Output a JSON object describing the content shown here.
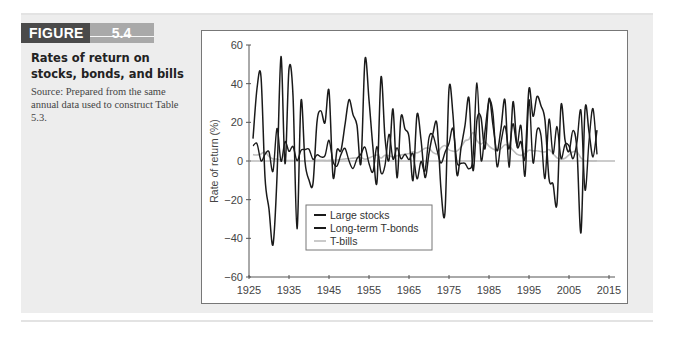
{
  "figure": {
    "label": "FIGURE",
    "number": "5.4",
    "title": "Rates of return on stocks, bonds, and bills",
    "source": "Source: Prepared from the same annual data used to construct Table 5.3."
  },
  "colors": {
    "stocks": "#1a1a1a",
    "bonds": "#1a1a1a",
    "bills": "#bdbdbd",
    "zero_line": "#9a9a9a",
    "axis": "#555555"
  },
  "chart_data": {
    "type": "line",
    "title": "Rates of return on stocks, bonds, and bills",
    "xlabel": "",
    "ylabel": "Rate of return (%)",
    "xlim": [
      1925,
      2015
    ],
    "ylim": [
      -60,
      60
    ],
    "xticks": [
      1925,
      1935,
      1945,
      1955,
      1965,
      1975,
      1985,
      1995,
      2005,
      2015
    ],
    "yticks": [
      -60,
      -40,
      -20,
      0,
      20,
      40,
      60
    ],
    "grid": false,
    "legend_position": "lower-left inside",
    "x": [
      1926,
      1927,
      1928,
      1929,
      1930,
      1931,
      1932,
      1933,
      1934,
      1935,
      1936,
      1937,
      1938,
      1939,
      1940,
      1941,
      1942,
      1943,
      1944,
      1945,
      1946,
      1947,
      1948,
      1949,
      1950,
      1951,
      1952,
      1953,
      1954,
      1955,
      1956,
      1957,
      1958,
      1959,
      1960,
      1961,
      1962,
      1963,
      1964,
      1965,
      1966,
      1967,
      1968,
      1969,
      1970,
      1971,
      1972,
      1973,
      1974,
      1975,
      1976,
      1977,
      1978,
      1979,
      1980,
      1981,
      1982,
      1983,
      1984,
      1985,
      1986,
      1987,
      1988,
      1989,
      1990,
      1991,
      1992,
      1993,
      1994,
      1995,
      1996,
      1997,
      1998,
      1999,
      2000,
      2001,
      2002,
      2003,
      2004,
      2005,
      2006,
      2007,
      2008,
      2009,
      2010,
      2011,
      2012
    ],
    "series": [
      {
        "name": "Large stocks",
        "values": [
          11.6,
          37.5,
          43.6,
          -8.4,
          -24.9,
          -43.3,
          -8.2,
          54.0,
          -1.4,
          47.7,
          33.9,
          -35.0,
          31.1,
          -0.4,
          -9.8,
          -11.6,
          20.3,
          25.9,
          19.8,
          36.4,
          -8.1,
          5.7,
          5.5,
          18.8,
          31.7,
          24.0,
          18.4,
          -1.0,
          52.6,
          31.6,
          6.6,
          -10.8,
          43.4,
          12.0,
          0.5,
          26.9,
          -8.7,
          22.8,
          16.5,
          12.5,
          -10.1,
          24.0,
          11.1,
          -8.5,
          4.0,
          14.3,
          19.0,
          -14.7,
          -26.5,
          37.2,
          23.8,
          -7.2,
          6.6,
          18.4,
          32.4,
          -4.9,
          21.4,
          22.5,
          6.3,
          32.2,
          18.5,
          5.2,
          16.8,
          31.5,
          -3.2,
          30.6,
          7.7,
          10.0,
          1.3,
          37.4,
          23.1,
          33.4,
          28.6,
          21.0,
          -9.1,
          -11.9,
          -22.1,
          28.7,
          10.9,
          4.9,
          15.8,
          5.5,
          -37.0,
          26.5,
          15.1,
          2.1,
          16.0
        ]
      },
      {
        "name": "Long-term T-bonds",
        "values": [
          7.8,
          8.9,
          0.1,
          3.4,
          4.7,
          -5.3,
          16.8,
          -0.1,
          10.0,
          5.0,
          7.5,
          0.2,
          5.5,
          5.9,
          6.1,
          0.9,
          3.2,
          2.1,
          2.8,
          10.7,
          -0.1,
          -2.6,
          3.4,
          6.5,
          0.1,
          -3.9,
          1.2,
          3.6,
          7.2,
          -1.3,
          -5.6,
          7.5,
          -6.1,
          -2.3,
          13.8,
          1.0,
          6.9,
          1.2,
          3.5,
          0.7,
          3.7,
          -9.2,
          -0.3,
          -5.1,
          12.1,
          13.2,
          5.7,
          -1.1,
          4.4,
          9.2,
          16.8,
          -0.7,
          -1.2,
          -1.2,
          -4.0,
          1.9,
          40.4,
          0.7,
          15.4,
          31.0,
          24.4,
          -2.7,
          9.7,
          18.1,
          6.2,
          19.3,
          8.1,
          18.2,
          -7.8,
          31.7,
          -0.9,
          15.9,
          13.1,
          -9.0,
          21.5,
          3.7,
          17.8,
          1.4,
          8.5,
          7.8,
          1.2,
          9.9,
          25.9,
          -14.9,
          10.1,
          27.1,
          3.4
        ]
      },
      {
        "name": "T-bills",
        "values": [
          3.3,
          3.1,
          3.6,
          4.7,
          2.4,
          1.1,
          1.0,
          0.3,
          0.2,
          0.2,
          0.2,
          0.3,
          0.0,
          0.0,
          0.0,
          0.1,
          0.3,
          0.4,
          0.3,
          0.3,
          0.4,
          0.5,
          0.8,
          1.1,
          1.2,
          1.5,
          1.7,
          1.8,
          0.9,
          1.6,
          2.5,
          3.1,
          1.5,
          3.0,
          2.7,
          2.1,
          2.7,
          3.1,
          3.5,
          3.9,
          4.8,
          4.2,
          5.2,
          6.6,
          6.5,
          4.4,
          3.8,
          6.9,
          8.0,
          5.8,
          5.1,
          5.1,
          7.2,
          10.4,
          11.2,
          14.7,
          10.5,
          8.8,
          9.9,
          7.7,
          6.2,
          5.5,
          6.4,
          8.4,
          7.8,
          5.6,
          3.5,
          2.9,
          3.9,
          5.6,
          5.2,
          5.3,
          4.9,
          4.7,
          5.9,
          3.8,
          1.6,
          1.0,
          1.4,
          3.2,
          4.8,
          4.7,
          1.5,
          0.1,
          0.1,
          0.0,
          0.1
        ]
      }
    ]
  }
}
